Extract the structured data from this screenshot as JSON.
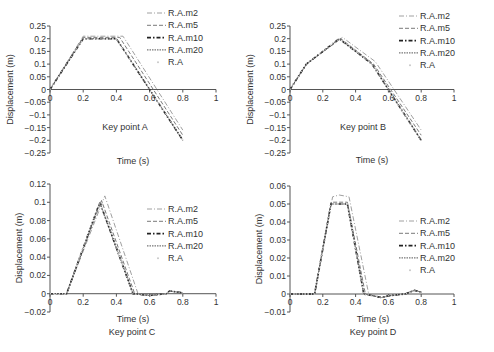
{
  "chart_data": [
    {
      "type": "line",
      "panel": "A",
      "title": "Key point A",
      "xlabel": "Time (s)",
      "ylabel": "Displacement (m)",
      "xlim": [
        0,
        1
      ],
      "ylim": [
        -0.25,
        0.25
      ],
      "xticks": [
        "0",
        "0.2",
        "0.4",
        "0.6",
        "0.8",
        "1"
      ],
      "yticks": [
        "0.25",
        "0.2",
        "0.15",
        "0.1",
        "0.05",
        "0",
        "-0.05",
        "-0.1",
        "-0.15",
        "-0.2",
        "-0.25"
      ],
      "legend": [
        "R.A.m2",
        "R.A.m5",
        "R.A.m10",
        "R.A.m20",
        "R.A"
      ],
      "legend_position": "upper right",
      "series": [
        {
          "name": "R.A.m2",
          "x": [
            0,
            0.2,
            0.44,
            0.8
          ],
          "y": [
            0,
            0.21,
            0.21,
            -0.16
          ]
        },
        {
          "name": "R.A.m5",
          "x": [
            0,
            0.2,
            0.42,
            0.8
          ],
          "y": [
            0,
            0.205,
            0.205,
            -0.18
          ]
        },
        {
          "name": "R.A.m10",
          "x": [
            0,
            0.2,
            0.4,
            0.8
          ],
          "y": [
            0,
            0.2,
            0.2,
            -0.2
          ]
        },
        {
          "name": "R.A.m20",
          "x": [
            0,
            0.2,
            0.4,
            0.8
          ],
          "y": [
            0,
            0.2,
            0.2,
            -0.2
          ]
        },
        {
          "name": "R.A",
          "x": [
            0,
            0.2,
            0.4,
            0.8
          ],
          "y": [
            0,
            0.2,
            0.2,
            -0.2
          ]
        }
      ]
    },
    {
      "type": "line",
      "panel": "B",
      "title": "Key point B",
      "xlabel": "Time (s)",
      "ylabel": "Displacement (m)",
      "xlim": [
        0,
        1
      ],
      "ylim": [
        -0.25,
        0.25
      ],
      "xticks": [
        "0",
        "0.2",
        "0.4",
        "0.6",
        "0.8",
        "1"
      ],
      "yticks": [
        "0.25",
        "0.2",
        "0.15",
        "0.1",
        "0.05",
        "0",
        "-0.05",
        "-0.1",
        "-0.15",
        "-0.2",
        "-0.25"
      ],
      "legend": [
        "R.A.m2",
        "R.A.m5",
        "R.A.m10",
        "R.A.m20",
        "R.A"
      ],
      "legend_position": "upper right",
      "series": [
        {
          "name": "R.A.m2",
          "x": [
            0,
            0.1,
            0.32,
            0.52,
            0.8
          ],
          "y": [
            0,
            0.1,
            0.205,
            0.11,
            -0.16
          ]
        },
        {
          "name": "R.A.m5",
          "x": [
            0,
            0.1,
            0.31,
            0.51,
            0.8
          ],
          "y": [
            0,
            0.1,
            0.2,
            0.1,
            -0.18
          ]
        },
        {
          "name": "R.A.m10",
          "x": [
            0,
            0.1,
            0.3,
            0.5,
            0.8
          ],
          "y": [
            0,
            0.1,
            0.2,
            0.1,
            -0.2
          ]
        },
        {
          "name": "R.A.m20",
          "x": [
            0,
            0.1,
            0.3,
            0.5,
            0.8
          ],
          "y": [
            0,
            0.1,
            0.2,
            0.1,
            -0.2
          ]
        },
        {
          "name": "R.A",
          "x": [
            0,
            0.1,
            0.3,
            0.5,
            0.8
          ],
          "y": [
            0,
            0.1,
            0.2,
            0.1,
            -0.2
          ]
        }
      ]
    },
    {
      "type": "line",
      "panel": "C",
      "title": "Key point C",
      "xlabel": "Time (s)",
      "ylabel": "Displacement (m)",
      "xlim": [
        0,
        1
      ],
      "ylim": [
        -0.02,
        0.12
      ],
      "xticks": [
        "0",
        "0.2",
        "0.4",
        "0.6",
        "0.8",
        "1"
      ],
      "yticks": [
        "0.12",
        "0.1",
        "0.08",
        "0.06",
        "0.04",
        "0.02",
        "0",
        "-0.02"
      ],
      "legend": [
        "R.A.m2",
        "R.A.m5",
        "R.A.m10",
        "R.A.m20",
        "R.A"
      ],
      "legend_position": "center right",
      "series": [
        {
          "name": "R.A.m2",
          "x": [
            0,
            0.1,
            0.33,
            0.53,
            0.6,
            0.7,
            0.72,
            0.8
          ],
          "y": [
            0,
            0,
            0.107,
            0,
            -0.002,
            0,
            0.003,
            0.001
          ]
        },
        {
          "name": "R.A.m5",
          "x": [
            0,
            0.1,
            0.31,
            0.51,
            0.6,
            0.7,
            0.72,
            0.8
          ],
          "y": [
            0,
            0,
            0.102,
            0,
            -0.002,
            0,
            0.003,
            0.001
          ]
        },
        {
          "name": "R.A.m10",
          "x": [
            0,
            0.1,
            0.3,
            0.5,
            0.6,
            0.7,
            0.72,
            0.8
          ],
          "y": [
            0,
            0,
            0.1,
            0,
            -0.002,
            0,
            0.003,
            0.001
          ]
        },
        {
          "name": "R.A.m20",
          "x": [
            0,
            0.1,
            0.3,
            0.5,
            0.6,
            0.7,
            0.72,
            0.8
          ],
          "y": [
            0,
            0,
            0.1,
            0,
            -0.002,
            0,
            0.003,
            0.001
          ]
        },
        {
          "name": "R.A",
          "x": [
            0,
            0.1,
            0.3,
            0.5,
            0.6,
            0.7,
            0.72,
            0.8
          ],
          "y": [
            0,
            0,
            0.1,
            0,
            -0.002,
            0,
            0.003,
            0.001
          ]
        }
      ]
    },
    {
      "type": "line",
      "panel": "D",
      "title": "Key point D",
      "xlabel": "Time (s)",
      "ylabel": "Displacement (m)",
      "xlim": [
        0,
        1
      ],
      "ylim": [
        -0.01,
        0.06
      ],
      "xticks": [
        "0",
        "0.2",
        "0.4",
        "0.6",
        "0.8",
        "1"
      ],
      "yticks": [
        "0.06",
        "0.05",
        "0.04",
        "0.03",
        "0.02",
        "0.01",
        "0",
        "-0.01"
      ],
      "legend": [
        "R.A.m2",
        "R.A.m5",
        "R.A.m10",
        "R.A.m20",
        "R.A"
      ],
      "legend_position": "center right",
      "series": [
        {
          "name": "R.A.m2",
          "x": [
            0,
            0.15,
            0.26,
            0.3,
            0.36,
            0.48,
            0.56,
            0.6,
            0.7,
            0.76,
            0.8
          ],
          "y": [
            0,
            0,
            0.054,
            0.055,
            0.054,
            0,
            -0.002,
            -0.001,
            0,
            0.002,
            0.001
          ]
        },
        {
          "name": "R.A.m5",
          "x": [
            0,
            0.15,
            0.25,
            0.35,
            0.46,
            0.56,
            0.6,
            0.7,
            0.76,
            0.8
          ],
          "y": [
            0,
            0,
            0.051,
            0.051,
            0,
            -0.002,
            -0.001,
            0,
            0.002,
            0.001
          ]
        },
        {
          "name": "R.A.m10",
          "x": [
            0,
            0.15,
            0.25,
            0.35,
            0.45,
            0.56,
            0.6,
            0.7,
            0.76,
            0.8
          ],
          "y": [
            0,
            0,
            0.05,
            0.05,
            0,
            -0.002,
            -0.001,
            0,
            0.002,
            0.001
          ]
        },
        {
          "name": "R.A.m20",
          "x": [
            0,
            0.15,
            0.25,
            0.35,
            0.45,
            0.56,
            0.6,
            0.7,
            0.76,
            0.8
          ],
          "y": [
            0,
            0,
            0.05,
            0.05,
            0,
            -0.002,
            -0.001,
            0,
            0.002,
            0.001
          ]
        },
        {
          "name": "R.A",
          "x": [
            0,
            0.15,
            0.25,
            0.35,
            0.45,
            0.56,
            0.6,
            0.7,
            0.76,
            0.8
          ],
          "y": [
            0,
            0,
            0.05,
            0.05,
            0,
            -0.002,
            -0.001,
            0,
            0.002,
            0.001
          ]
        }
      ]
    }
  ],
  "styles": {
    "R.A.m2": {
      "color": "#a0a0a0",
      "dash": "5,2,1,2",
      "width": 1
    },
    "R.A.m5": {
      "color": "#7a7a7a",
      "dash": "4,2",
      "width": 1
    },
    "R.A.m10": {
      "color": "#222222",
      "dash": "4,2,1.5,2",
      "width": 1.6
    },
    "R.A.m20": {
      "color": "#555555",
      "dash": "1.5,1",
      "width": 1
    },
    "R.A": {
      "color": "#c8c8c8",
      "dash": "1,2",
      "width": 1.4
    }
  }
}
